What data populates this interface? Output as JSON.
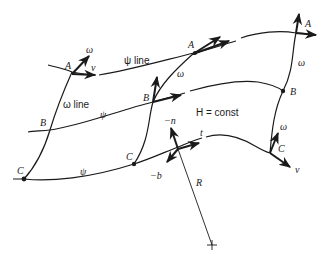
{
  "diagram": {
    "labels": {
      "psi_line": "ψ line",
      "omega_line": "ω line",
      "psi": "ψ",
      "omega": "ω",
      "h_const": "H = const",
      "v": "v",
      "t": "t",
      "minus_n": "−n",
      "minus_b": "−b",
      "R": "R",
      "A": "A",
      "B": "B",
      "C": "C"
    },
    "points": [
      {
        "id": "A-left",
        "label": "A",
        "x": 72,
        "y": 72
      },
      {
        "id": "A-mid",
        "label": "A",
        "x": 194,
        "y": 53
      },
      {
        "id": "A-right",
        "label": "A",
        "x": 296,
        "y": 33
      },
      {
        "id": "B-left",
        "label": "B",
        "x": 50,
        "y": 130
      },
      {
        "id": "B-mid",
        "label": "B",
        "x": 153,
        "y": 102
      },
      {
        "id": "B-right",
        "label": "B",
        "x": 283,
        "y": 91
      },
      {
        "id": "C-left",
        "label": "C",
        "x": 24,
        "y": 179
      },
      {
        "id": "C-mid",
        "label": "C",
        "x": 134,
        "y": 164
      },
      {
        "id": "C-right",
        "label": "C",
        "x": 270,
        "y": 153
      }
    ],
    "colors": {
      "ink": "#1a1a1a",
      "background": "#ffffff"
    }
  }
}
